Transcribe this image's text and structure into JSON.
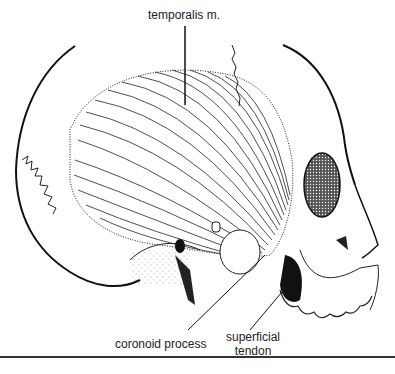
{
  "figure": {
    "labels": [
      {
        "id": "temporalis",
        "text": "temporalis m."
      },
      {
        "id": "coronoid",
        "text": "coronoid process"
      },
      {
        "id": "tendon_line1",
        "text": "superficial"
      },
      {
        "id": "tendon_line2",
        "text": "tendon"
      }
    ],
    "colors": {
      "ink": "#222222",
      "background": "#ffffff"
    }
  }
}
